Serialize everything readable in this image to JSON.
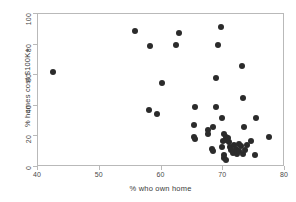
{
  "chart_data": {
    "type": "scatter",
    "title": "",
    "xlabel": "% who own home",
    "ylabel": "% homes cost $100K+",
    "xlim": [
      40,
      80
    ],
    "ylim": [
      0,
      100
    ],
    "xticks": [
      40,
      50,
      60,
      70,
      80
    ],
    "yticks": [
      0,
      20,
      40,
      60,
      80,
      100
    ],
    "grid": false,
    "legend": null,
    "marker": {
      "shape": "circle",
      "color": "#2b2b2b",
      "size": 6
    },
    "points": [
      {
        "x": 42.5,
        "y": 62.0
      },
      {
        "x": 55.7,
        "y": 89.0
      },
      {
        "x": 58.1,
        "y": 79.2
      },
      {
        "x": 62.3,
        "y": 79.8
      },
      {
        "x": 62.9,
        "y": 87.3
      },
      {
        "x": 69.6,
        "y": 91.3
      },
      {
        "x": 69.1,
        "y": 79.5
      },
      {
        "x": 73.1,
        "y": 65.8
      },
      {
        "x": 68.8,
        "y": 58.3
      },
      {
        "x": 60.1,
        "y": 54.7
      },
      {
        "x": 73.2,
        "y": 45.0
      },
      {
        "x": 58.0,
        "y": 37.5
      },
      {
        "x": 59.2,
        "y": 34.9
      },
      {
        "x": 65.5,
        "y": 39.2
      },
      {
        "x": 68.9,
        "y": 39.4
      },
      {
        "x": 69.8,
        "y": 31.7
      },
      {
        "x": 75.3,
        "y": 32.1
      },
      {
        "x": 65.3,
        "y": 27.6
      },
      {
        "x": 68.4,
        "y": 25.9
      },
      {
        "x": 73.4,
        "y": 26.0
      },
      {
        "x": 67.5,
        "y": 24.4
      },
      {
        "x": 67.5,
        "y": 21.8
      },
      {
        "x": 65.3,
        "y": 19.8
      },
      {
        "x": 65.4,
        "y": 18.1
      },
      {
        "x": 70.2,
        "y": 21.4
      },
      {
        "x": 70.4,
        "y": 19.6
      },
      {
        "x": 70.5,
        "y": 17.8
      },
      {
        "x": 71.0,
        "y": 16.2
      },
      {
        "x": 74.5,
        "y": 17.2
      },
      {
        "x": 77.4,
        "y": 19.6
      },
      {
        "x": 68.2,
        "y": 11.6
      },
      {
        "x": 68.3,
        "y": 10.4
      },
      {
        "x": 69.8,
        "y": 13.0
      },
      {
        "x": 70.1,
        "y": 8.0
      },
      {
        "x": 70.2,
        "y": 6.1
      },
      {
        "x": 70.4,
        "y": 4.8
      },
      {
        "x": 71.1,
        "y": 13.3
      },
      {
        "x": 71.3,
        "y": 11.0
      },
      {
        "x": 71.5,
        "y": 9.0
      },
      {
        "x": 71.8,
        "y": 14.5
      },
      {
        "x": 72.0,
        "y": 12.0
      },
      {
        "x": 72.2,
        "y": 8.4
      },
      {
        "x": 72.5,
        "y": 15.0
      },
      {
        "x": 72.6,
        "y": 10.5
      },
      {
        "x": 72.9,
        "y": 13.5
      },
      {
        "x": 73.2,
        "y": 8.8
      },
      {
        "x": 73.6,
        "y": 11.4
      },
      {
        "x": 75.1,
        "y": 7.9
      },
      {
        "x": 69.9,
        "y": 17.0
      },
      {
        "x": 70.8,
        "y": 19.0
      },
      {
        "x": 73.9,
        "y": 14.2
      }
    ]
  }
}
